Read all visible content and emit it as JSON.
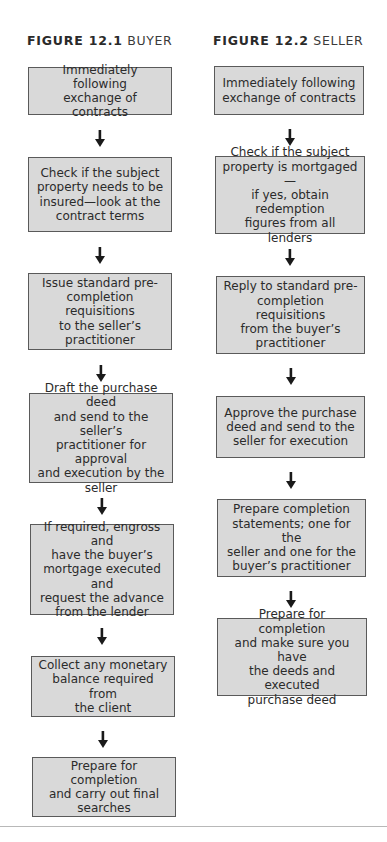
{
  "figures": [
    {
      "number": "FIGURE 12.1",
      "label": "BUYER",
      "steps": [
        "Immediately following\nexchange of contracts",
        "Check if the subject\nproperty needs to be\ninsured—look at the\ncontract terms",
        "Issue standard pre-\ncompletion requisitions\nto the seller’s\npractitioner",
        "Draft the purchase deed\nand send to the seller’s\npractitioner for approval\nand execution by the\nseller",
        "If required, engross and\nhave the buyer’s\nmortgage executed and\nrequest the advance\nfrom the lender",
        "Collect any monetary\nbalance required from\nthe client",
        "Prepare for completion\nand carry out final\nsearches"
      ]
    },
    {
      "number": "FIGURE 12.2",
      "label": "SELLER",
      "steps": [
        "Immediately following\nexchange of contracts",
        "Check if the subject\nproperty is mortgaged—\nif yes, obtain redemption\nfigures from all lenders",
        "Reply to standard pre-\ncompletion requisitions\nfrom the buyer’s\npractitioner",
        "Approve the purchase\ndeed and send to the\nseller for execution",
        "Prepare completion\nstatements; one for the\nseller and one for the\nbuyer’s practitioner",
        "Prepare for completion\nand make sure you have\nthe deeds and executed\npurchase deed"
      ]
    }
  ],
  "colors": {
    "box_fill": "#d9d9d9",
    "box_border": "#5a5a5a",
    "arrow": "#1a1a1a",
    "text": "#2b2b2b"
  },
  "icons": {
    "arrow": "arrow-down-icon"
  }
}
